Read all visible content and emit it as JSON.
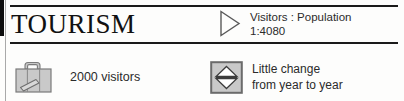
{
  "panel": {
    "title": "TOURISM",
    "colors": {
      "rule": "#1a1a1a",
      "text": "#2b2b2b",
      "icon_fill": "#c9c9c9",
      "icon_stroke": "#6e6e6e",
      "edge_black": "#0d0d0d"
    }
  },
  "header": {
    "arrow_icon": "triangle-right-icon",
    "ratio_line1": "Visitors : Population",
    "ratio_line2": "1:4080"
  },
  "stats": {
    "visitors": {
      "icon": "suitcase-icon",
      "label": "2000 visitors"
    },
    "trend": {
      "icon": "up-down-arrows-icon",
      "line1": "Little change",
      "line2": "from year to year"
    }
  }
}
